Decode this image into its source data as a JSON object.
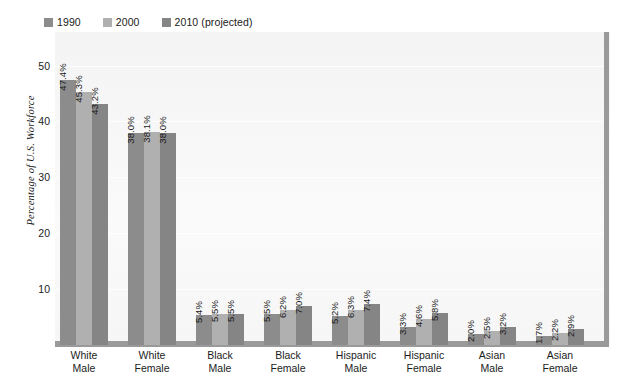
{
  "chart_data": {
    "type": "bar",
    "title": "",
    "subtitle": "",
    "xlabel": "",
    "ylabel": "Percentage of U.S. Workforce",
    "ylim": [
      0,
      56
    ],
    "yticks": [
      10,
      20,
      30,
      40,
      50
    ],
    "ytick_labels": [
      "10",
      "20",
      "30",
      "40",
      "50"
    ],
    "grid": true,
    "legend_position": "top-left",
    "categories": [
      "White Male",
      "White Female",
      "Black Male",
      "Black Female",
      "Hispanic Male",
      "Hispanic Female",
      "Asian Male",
      "Asian Female"
    ],
    "category_lines": [
      [
        "White",
        "Male"
      ],
      [
        "White",
        "Female"
      ],
      [
        "Black",
        "Male"
      ],
      [
        "Black",
        "Female"
      ],
      [
        "Hispanic",
        "Male"
      ],
      [
        "Hispanic",
        "Female"
      ],
      [
        "Asian",
        "Male"
      ],
      [
        "Asian",
        "Female"
      ]
    ],
    "series": [
      {
        "name": "1990",
        "color": "#8c8c8c",
        "values": [
          47.4,
          38.0,
          5.4,
          5.5,
          5.2,
          3.3,
          2.0,
          1.7
        ],
        "labels": [
          "47.4%",
          "38.0%",
          "5.4%",
          "5.5%",
          "5.2%",
          "3.3%",
          "2.0%",
          "1.7%"
        ]
      },
      {
        "name": "2000",
        "color": "#b0b0b0",
        "values": [
          45.3,
          38.1,
          5.5,
          6.2,
          6.3,
          4.6,
          2.5,
          2.2
        ],
        "labels": [
          "45.3%",
          "38.1%",
          "5.5%",
          "6.2%",
          "6.3%",
          "4.6%",
          "2.5%",
          "2.2%"
        ]
      },
      {
        "name": "2010 (projected)",
        "color": "#858585",
        "values": [
          43.2,
          38.0,
          5.5,
          7.0,
          7.4,
          5.8,
          3.2,
          2.9
        ],
        "labels": [
          "43.2%",
          "38.0%",
          "5.5%",
          "7.0%",
          "7.4%",
          "5.8%",
          "3.2%",
          "2.9%"
        ]
      }
    ]
  },
  "legend": {
    "items": [
      {
        "label": "1990",
        "color": "#8c8c8c"
      },
      {
        "label": "2000",
        "color": "#b0b0b0"
      },
      {
        "label": "2010 (projected)",
        "color": "#858585"
      }
    ]
  },
  "colors": {
    "plot_background": "#f7f7f7",
    "axis": "#9a9a9a",
    "gridline": "#ffffff",
    "text": "#1c1c1c"
  }
}
